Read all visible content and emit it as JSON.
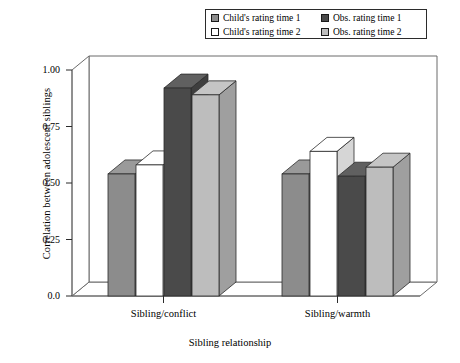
{
  "chart_data": {
    "type": "bar",
    "title": "",
    "subtitle": "",
    "xlabel": "Sibling relationship",
    "ylabel": "Correlation between adolescent siblings",
    "categories": [
      "Sibling/conflict",
      "Sibling/warmth"
    ],
    "ylim": [
      0.0,
      1.0
    ],
    "ytick_labels": [
      "0.0",
      "0.25",
      "0.50",
      "0.75",
      "1.00"
    ],
    "ytick_values": [
      0.0,
      0.25,
      0.5,
      0.75,
      1.0
    ],
    "grid": false,
    "legend_position": "top-right",
    "style": "3d-bars",
    "series": [
      {
        "name": "Child's rating time 1",
        "color": "#8c8c8c",
        "values": [
          0.54,
          0.54
        ]
      },
      {
        "name": "Child's rating time 2",
        "color": "#ffffff",
        "values": [
          0.58,
          0.64
        ]
      },
      {
        "name": "Obs. rating time 1",
        "color": "#4a4a4a",
        "values": [
          0.92,
          0.53
        ]
      },
      {
        "name": "Obs. rating time 2",
        "color": "#bdbdbd",
        "values": [
          0.89,
          0.57
        ]
      }
    ]
  },
  "legend": {
    "entries": [
      {
        "label": "Child's rating time 1",
        "color": "#8c8c8c"
      },
      {
        "label": "Child's rating time 2",
        "color": "#ffffff"
      },
      {
        "label": "Obs. rating time 1",
        "color": "#4a4a4a"
      },
      {
        "label": "Obs. rating time 2",
        "color": "#bdbdbd"
      }
    ]
  },
  "axes": {
    "y_title": "Correlation between adolescent siblings",
    "x_title": "Sibling relationship",
    "y_ticks": [
      "1.00",
      "0.75",
      "0.50",
      "0.25",
      "0.0"
    ],
    "x_categories": [
      "Sibling/conflict",
      "Sibling/warmth"
    ]
  },
  "colors": {
    "frame": "#6b6b6b",
    "outline": "#2b2b2b",
    "background": "#ffffff"
  }
}
